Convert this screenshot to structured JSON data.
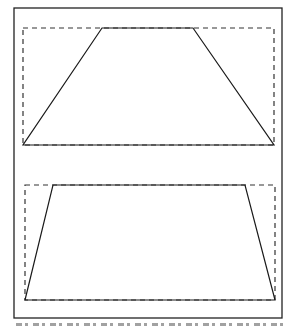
{
  "figure": {
    "frame": {
      "x": 14,
      "y": 8,
      "w": 268,
      "h": 310
    },
    "panels": [
      {
        "name": "top-panel",
        "dashed_rect": {
          "x1": 23,
          "y1": 28,
          "x2": 274,
          "y2": 145
        },
        "trapezoid": [
          [
            102,
            28
          ],
          [
            193,
            28
          ],
          [
            274,
            145
          ],
          [
            23,
            145
          ]
        ]
      },
      {
        "name": "bottom-panel",
        "dashed_rect": {
          "x1": 25,
          "y1": 185,
          "x2": 275,
          "y2": 300
        },
        "trapezoid": [
          [
            53,
            185
          ],
          [
            245,
            185
          ],
          [
            275,
            300
          ],
          [
            25,
            300
          ]
        ]
      }
    ],
    "colors": {
      "line": "#1a1a1a",
      "dash": "#333333",
      "frame": "#222222",
      "background": "#ffffff"
    }
  }
}
